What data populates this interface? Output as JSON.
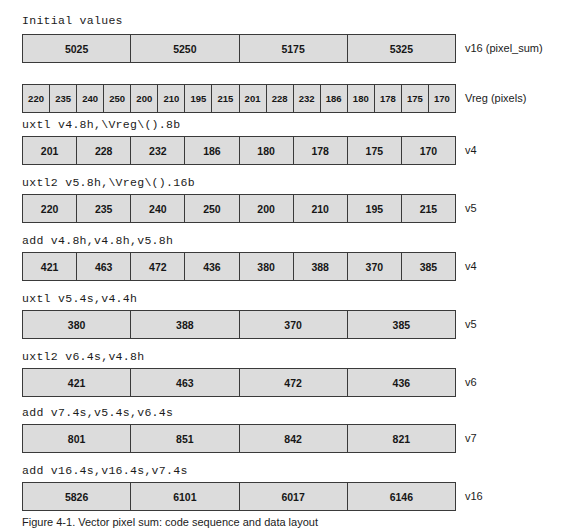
{
  "figure": {
    "section_heading": "Initial values",
    "caption": "Figure 4-1. Vector pixel sum: code sequence and data layout"
  },
  "rows": [
    {
      "id": "row-initial-v16",
      "instruction": "",
      "register": "v16 (pixel_sum)",
      "lane_count": 4,
      "values": [
        "5025",
        "5250",
        "5175",
        "5325"
      ],
      "heading_above": "Initial values"
    },
    {
      "id": "row-initial-vreg",
      "instruction": "",
      "register": "Vreg (pixels)",
      "lane_count": 16,
      "values": [
        "220",
        "235",
        "240",
        "250",
        "200",
        "210",
        "195",
        "215",
        "201",
        "228",
        "232",
        "186",
        "180",
        "178",
        "175",
        "170"
      ]
    },
    {
      "id": "row-uxtl-v4",
      "instruction": "uxtl v4.8h,\\Vreg\\().8b",
      "register": "v4",
      "lane_count": 8,
      "values": [
        "201",
        "228",
        "232",
        "186",
        "180",
        "178",
        "175",
        "170"
      ]
    },
    {
      "id": "row-uxtl2-v5",
      "instruction": "uxtl2 v5.8h,\\Vreg\\().16b",
      "register": "v5",
      "lane_count": 8,
      "values": [
        "220",
        "235",
        "240",
        "250",
        "200",
        "210",
        "195",
        "215"
      ]
    },
    {
      "id": "row-add-v4",
      "instruction": "add v4.8h,v4.8h,v5.8h",
      "register": "v4",
      "lane_count": 8,
      "values": [
        "421",
        "463",
        "472",
        "436",
        "380",
        "388",
        "370",
        "385"
      ]
    },
    {
      "id": "row-uxtl-v5",
      "instruction": "uxtl v5.4s,v4.4h",
      "register": "v5",
      "lane_count": 4,
      "values": [
        "380",
        "388",
        "370",
        "385"
      ]
    },
    {
      "id": "row-uxtl2-v6",
      "instruction": "uxtl2 v6.4s,v4.8h",
      "register": "v6",
      "lane_count": 4,
      "values": [
        "421",
        "463",
        "472",
        "436"
      ]
    },
    {
      "id": "row-add-v7",
      "instruction": "add v7.4s,v5.4s,v6.4s",
      "register": "v7",
      "lane_count": 4,
      "values": [
        "801",
        "851",
        "842",
        "821"
      ]
    },
    {
      "id": "row-add-v16",
      "instruction": "add v16.4s,v16.4s,v7.4s",
      "register": "v16",
      "lane_count": 4,
      "values": [
        "5826",
        "6101",
        "6017",
        "6146"
      ]
    }
  ],
  "colors": {
    "lane_fill": "#dcdcdc",
    "lane_border": "#3a3a3a",
    "text": "#1b1b1b",
    "background": "#ffffff"
  },
  "layout": {
    "heading_top": 16,
    "row_tops": [
      34,
      84,
      136,
      194,
      252,
      310,
      368,
      424,
      482
    ],
    "instr_offsets": [
      null,
      null,
      -18,
      -18,
      -18,
      -18,
      -18,
      -18,
      -18
    ],
    "caption_top": 512
  }
}
